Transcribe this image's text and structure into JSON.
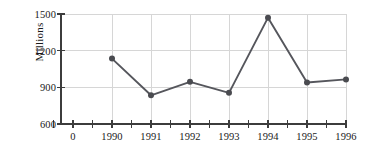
{
  "chart_data": {
    "type": "line",
    "title": "",
    "xlabel": "",
    "ylabel": "Millions",
    "categories": [
      "1990",
      "1991",
      "1992",
      "1993",
      "1994",
      "1995",
      "1996"
    ],
    "values": [
      1135,
      835,
      945,
      855,
      1470,
      940,
      965
    ],
    "series": [
      {
        "name": "Millions",
        "values": [
          1135,
          835,
          945,
          855,
          1470,
          940,
          965
        ]
      }
    ],
    "ylim": [
      600,
      1500
    ],
    "y_ticks": [
      "600",
      "900",
      "1200",
      "1500"
    ],
    "y_tick_values": [
      600,
      900,
      1200,
      1500
    ],
    "x_origin_label": "0",
    "x_tick_labels": [
      "0",
      "1990",
      "1991",
      "1992",
      "1993",
      "1994",
      "1995",
      "1996"
    ],
    "grid": true,
    "minor_x_ticks": true,
    "legend": "none",
    "marker": "circle",
    "line_color": "#55565c",
    "marker_color": "#4a4b50",
    "grid_color": "#d6d6d6",
    "axis_color": "#3c3c3c",
    "background_color": "#ffffff"
  }
}
